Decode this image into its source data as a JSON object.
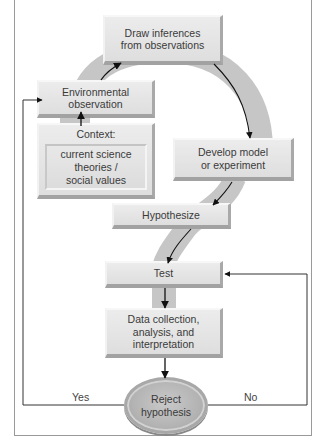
{
  "diagram": {
    "nodes": {
      "draw_inferences": "Draw inferences\nfrom observations",
      "environmental_observation": "Environmental\nobservation",
      "context_label": "Context:",
      "context_detail": "current science\ntheories /\nsocial values",
      "develop_model": "Develop model\nor experiment",
      "hypothesize": "Hypothesize",
      "test": "Test",
      "data_collection": "Data collection,\nanalysis, and\ninterpretation",
      "reject_hypothesis": "Reject\nhypothesis"
    },
    "edge_labels": {
      "yes": "Yes",
      "no": "No"
    },
    "colors": {
      "band": "#c6c6c6",
      "box": "#e4e4e4",
      "arrow": "#111111",
      "feedback_line": "#333333"
    }
  }
}
